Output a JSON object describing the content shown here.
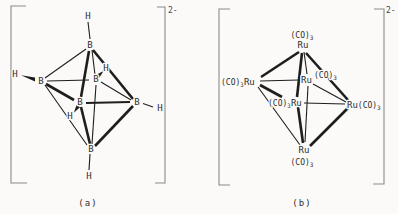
{
  "figure_title": "octahedral cluster comparison",
  "colors": {
    "ink": "#1e1e1e",
    "text": "#2e2e2e",
    "bracket": "#8a8a8a",
    "background": "#fbfaf8"
  },
  "structure_a": {
    "caption": "(a)",
    "charge": "2-",
    "boron": "B",
    "hydrogen": "H",
    "atom_count_boron": 6,
    "atom_count_hydrogen": 6
  },
  "structure_b": {
    "caption": "(b)",
    "charge": "2-",
    "ruthenium": "Ru",
    "carbonyl": "(CO)",
    "carbonyl_subscript": "3",
    "vertex_count": 6
  }
}
